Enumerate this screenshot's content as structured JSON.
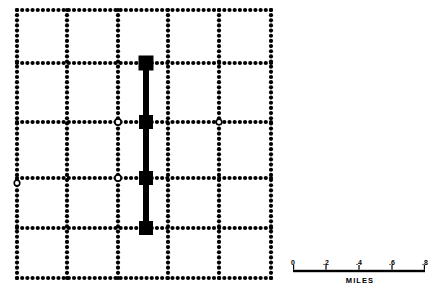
{
  "figure": {
    "type": "schematic-street-grid-map",
    "background_color": "#ffffff",
    "ink_color": "#000000"
  },
  "map": {
    "name": "street-grid-map",
    "description": "Dotted rectangular street grid with a highlighted north-south corridor",
    "bounds": {
      "x": 17,
      "y": 10,
      "width": 255,
      "height": 268
    },
    "grid": {
      "style": "dotted",
      "dot_radius": 2.1,
      "dot_spacing": 5.2,
      "vertical_streets_x": [
        17,
        67,
        118,
        168,
        219,
        271
      ],
      "horizontal_streets_y": [
        10,
        63,
        122,
        178,
        228,
        278
      ]
    },
    "route": {
      "name": "highlighted-corridor",
      "orientation": "vertical",
      "x": 146,
      "y_start": 63,
      "y_end": 228,
      "line_width": 6,
      "color": "#000000"
    },
    "route_nodes": [
      {
        "label": "node-north",
        "x": 146,
        "y": 63,
        "size": 15
      },
      {
        "label": "node-mid-upper",
        "x": 146,
        "y": 122,
        "size": 14
      },
      {
        "label": "node-mid-lower",
        "x": 146,
        "y": 178,
        "size": 14
      },
      {
        "label": "node-south",
        "x": 146,
        "y": 228,
        "size": 14
      }
    ],
    "open_nodes": [
      {
        "label": "open-intersection-left-mid",
        "x": 118,
        "y": 122,
        "radius": 3.1
      },
      {
        "label": "open-intersection-left-low",
        "x": 118,
        "y": 178,
        "radius": 3.1
      },
      {
        "label": "open-intersection-edge",
        "x": 17,
        "y": 183,
        "radius": 2.8
      },
      {
        "label": "open-intersection-right-mid",
        "x": 219,
        "y": 122,
        "radius": 2.8
      }
    ]
  },
  "scale_bar": {
    "name": "scale-bar",
    "title": "MILES",
    "units": "miles",
    "x_start": 293,
    "x_end": 425,
    "baseline_y": 271,
    "bar_thickness": 2.4,
    "ticks": [
      {
        "label": "0",
        "value": 0.0,
        "x": 293
      },
      {
        "label": ".2",
        "value": 0.2,
        "x": 326
      },
      {
        "label": ".4",
        "value": 0.4,
        "x": 359
      },
      {
        "label": ".6",
        "value": 0.6,
        "x": 392
      },
      {
        "label": ".8",
        "value": 0.8,
        "x": 425
      }
    ],
    "tick_label_y": 259,
    "title_y": 277
  }
}
